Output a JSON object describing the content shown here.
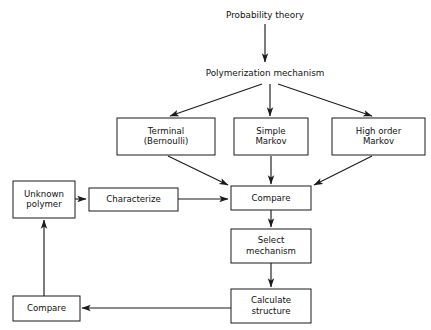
{
  "diagram": {
    "background_color": "#ffffff",
    "line_color": "#1b1b1b",
    "box_fill": "#ffffff",
    "free_labels": [
      {
        "id": "probability-theory",
        "text": "Probability theory",
        "x": 265,
        "y": 15
      },
      {
        "id": "polymerization-mechanism",
        "text": "Polymerization mechanism",
        "x": 265,
        "y": 73
      }
    ],
    "nodes": [
      {
        "id": "terminal-bernoulli",
        "line1": "Terminal",
        "line2": "(Bernoulli)",
        "x": 117,
        "y": 118,
        "w": 98,
        "h": 37
      },
      {
        "id": "simple-markov",
        "line1": "Simple",
        "line2": "Markov",
        "x": 234,
        "y": 118,
        "w": 74,
        "h": 37
      },
      {
        "id": "high-order-markov",
        "line1": "High order",
        "line2": "Markov",
        "x": 332,
        "y": 118,
        "w": 93,
        "h": 37
      },
      {
        "id": "unknown-polymer",
        "line1": "Unknown",
        "line2": "polymer",
        "x": 13,
        "y": 181,
        "w": 62,
        "h": 37
      },
      {
        "id": "characterize",
        "line1": "Characterize",
        "line2": "",
        "x": 89,
        "y": 188,
        "w": 89,
        "h": 23
      },
      {
        "id": "compare-main",
        "line1": "Compare",
        "line2": "",
        "x": 231,
        "y": 186,
        "w": 80,
        "h": 24
      },
      {
        "id": "select-mechanism",
        "line1": "Select",
        "line2": "mechanism",
        "x": 231,
        "y": 229,
        "w": 80,
        "h": 34
      },
      {
        "id": "calculate-structure",
        "line1": "Calculate",
        "line2": "structure",
        "x": 231,
        "y": 289,
        "w": 80,
        "h": 34
      },
      {
        "id": "compare-bottom",
        "line1": "Compare",
        "line2": "",
        "x": 13,
        "y": 296,
        "w": 67,
        "h": 25
      }
    ],
    "edges": [
      {
        "id": "probability-to-polymerization",
        "from": "probability-theory",
        "to": "polymerization-mechanism",
        "points": "265,24 265,62",
        "arrow": true
      },
      {
        "id": "polymerization-to-terminal",
        "from": "polymerization-mechanism",
        "to": "terminal-bernoulli",
        "points": "262,84 170,116",
        "arrow": true
      },
      {
        "id": "polymerization-to-simple",
        "from": "polymerization-mechanism",
        "to": "simple-markov",
        "points": "270,84 270,116",
        "arrow": true
      },
      {
        "id": "polymerization-to-highorder",
        "from": "polymerization-mechanism",
        "to": "high-order-markov",
        "points": "278,84 372,116",
        "arrow": true
      },
      {
        "id": "terminal-to-compare",
        "from": "terminal-bernoulli",
        "to": "compare-main",
        "points": "168,156 228,185",
        "arrow": true
      },
      {
        "id": "simple-to-compare",
        "from": "simple-markov",
        "to": "compare-main",
        "points": "271,156 271,184",
        "arrow": true
      },
      {
        "id": "highorder-to-compare",
        "from": "high-order-markov",
        "to": "compare-main",
        "points": "372,156 314,185",
        "arrow": true
      },
      {
        "id": "unknown-to-characterize",
        "from": "unknown-polymer",
        "to": "characterize",
        "points": "75,199 86,199",
        "arrow": true
      },
      {
        "id": "characterize-to-compare",
        "from": "characterize",
        "to": "compare-main",
        "points": "178,199 228,199",
        "arrow": true
      },
      {
        "id": "compare-to-select",
        "from": "compare-main",
        "to": "select-mechanism",
        "points": "271,210 271,227",
        "arrow": true
      },
      {
        "id": "select-to-calculate",
        "from": "select-mechanism",
        "to": "calculate-structure",
        "points": "271,263 271,287",
        "arrow": true
      },
      {
        "id": "calculate-to-compare-bottom",
        "from": "calculate-structure",
        "to": "compare-bottom",
        "points": "231,308 82,308",
        "arrow": true
      },
      {
        "id": "compare-bottom-to-unknown",
        "from": "compare-bottom",
        "to": "unknown-polymer",
        "points": "44,296 44,220",
        "arrow": true
      }
    ]
  }
}
